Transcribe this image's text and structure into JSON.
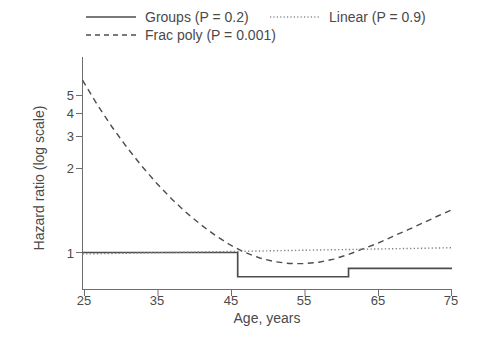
{
  "chart_data": {
    "type": "line",
    "title": "",
    "xlabel": "Age, years",
    "ylabel": "Hazard ratio (log scale)",
    "xlim": [
      25,
      75
    ],
    "ylim": [
      0.7,
      6.4
    ],
    "yscale": "log",
    "grid": false,
    "legend_position": "top",
    "xticks": [
      25,
      35,
      45,
      55,
      65,
      75
    ],
    "xticklabels": [
      "25",
      "35",
      "45",
      "55",
      "65",
      "75"
    ],
    "yticks": [
      1,
      2,
      3,
      4,
      5
    ],
    "yticklabels": [
      "1",
      "2",
      "3",
      "4",
      "5"
    ],
    "series": [
      {
        "name": "Groups (P = 0.2)",
        "style": "solid",
        "type": "step",
        "color": "#4d4d4d",
        "x": [
          25,
          46,
          46,
          61,
          61,
          75
        ],
        "y": [
          1.0,
          1.0,
          0.78,
          0.78,
          0.85,
          0.85
        ]
      },
      {
        "name": "Frac poly (P = 0.001)",
        "style": "dashed",
        "type": "curve",
        "color": "#4d4d4d",
        "x": [
          25,
          27,
          29,
          31,
          33,
          35,
          37,
          39,
          41,
          43,
          45,
          47,
          49,
          51,
          53,
          55,
          57,
          59,
          61,
          63,
          65,
          67,
          69,
          71,
          73,
          75
        ],
        "y": [
          5.85,
          4.55,
          3.62,
          2.94,
          2.43,
          2.04,
          1.74,
          1.51,
          1.33,
          1.19,
          1.08,
          1.0,
          0.945,
          0.91,
          0.893,
          0.892,
          0.905,
          0.935,
          0.98,
          1.04,
          1.1,
          1.18,
          1.26,
          1.35,
          1.45,
          1.55
        ]
      },
      {
        "name": "Linear (P = 0.9)",
        "style": "dotted",
        "type": "line",
        "color": "#808080",
        "x": [
          25,
          75
        ],
        "y": [
          0.985,
          1.05
        ]
      }
    ]
  },
  "legend": {
    "items": [
      {
        "label": "Groups (P = 0.2)",
        "style": "solid"
      },
      {
        "label": "Linear (P = 0.9)",
        "style": "dotted"
      },
      {
        "label": "Frac poly (P = 0.001)",
        "style": "dashed"
      }
    ]
  },
  "axes": {
    "y_title": "Hazard ratio (log scale)",
    "x_title": "Age, years",
    "y_tick_labels": [
      "5",
      "4",
      "3",
      "2",
      "1"
    ],
    "x_tick_labels": [
      "25",
      "35",
      "45",
      "55",
      "65",
      "75"
    ]
  },
  "colors": {
    "line_dark": "#4d4d4d",
    "line_light": "#808080",
    "axis": "#6e6e6e",
    "text": "#4a4a4a",
    "background": "#ffffff"
  }
}
